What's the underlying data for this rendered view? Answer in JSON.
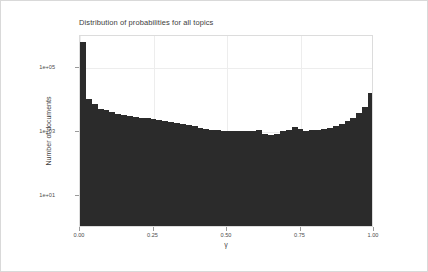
{
  "figure": {
    "title": "Distribution of probabilities for all topics",
    "background_color": "#ffffff",
    "border_color": "#d9d9d9",
    "panel_border_color": "#dcdcdc",
    "grid_color": "#ededed",
    "bar_color": "#2b2b2b"
  },
  "chart_data": {
    "type": "bar",
    "title": "Distribution of probabilities for all topics",
    "xlabel": "γ",
    "ylabel": "Number of documents",
    "grid": true,
    "legend": "none",
    "yscale": "log10",
    "xlim": [
      0.0,
      1.0
    ],
    "ylim": [
      1,
      1000000
    ],
    "xticks": [
      0.0,
      0.25,
      0.5,
      0.75,
      1.0
    ],
    "xtick_labels": [
      "0.00",
      "0.25",
      "0.50",
      "0.75",
      "1.00"
    ],
    "yticks": [
      10,
      1000,
      100000
    ],
    "ytick_labels": [
      "1e+01",
      "1e+03",
      "1e+05"
    ],
    "bin_width": 0.02,
    "bin_centers": [
      0.01,
      0.03,
      0.05,
      0.07,
      0.09,
      0.11,
      0.13,
      0.15,
      0.17,
      0.19,
      0.21,
      0.23,
      0.25,
      0.27,
      0.29,
      0.31,
      0.33,
      0.35,
      0.37,
      0.39,
      0.41,
      0.43,
      0.45,
      0.47,
      0.49,
      0.51,
      0.53,
      0.55,
      0.57,
      0.59,
      0.61,
      0.63,
      0.65,
      0.67,
      0.69,
      0.71,
      0.73,
      0.75,
      0.77,
      0.79,
      0.81,
      0.83,
      0.85,
      0.87,
      0.89,
      0.91,
      0.93,
      0.95,
      0.97,
      0.99
    ],
    "values": [
      560000,
      9200,
      6400,
      4700,
      4200,
      3600,
      3100,
      2900,
      2700,
      2500,
      2400,
      2300,
      2200,
      2000,
      1850,
      1750,
      1600,
      1500,
      1400,
      1300,
      1150,
      1050,
      1000,
      980,
      960,
      950,
      940,
      930,
      950,
      900,
      1000,
      760,
      700,
      740,
      900,
      1000,
      1250,
      1100,
      900,
      980,
      1000,
      1050,
      1150,
      1300,
      1500,
      1900,
      2400,
      3400,
      5400,
      14500
    ],
    "categories": [
      "0.01",
      "0.03",
      "0.05",
      "0.07",
      "0.09",
      "0.11",
      "0.13",
      "0.15",
      "0.17",
      "0.19",
      "0.21",
      "0.23",
      "0.25",
      "0.27",
      "0.29",
      "0.31",
      "0.33",
      "0.35",
      "0.37",
      "0.39",
      "0.41",
      "0.43",
      "0.45",
      "0.47",
      "0.49",
      "0.51",
      "0.53",
      "0.55",
      "0.57",
      "0.59",
      "0.61",
      "0.63",
      "0.65",
      "0.67",
      "0.69",
      "0.71",
      "0.73",
      "0.75",
      "0.77",
      "0.79",
      "0.81",
      "0.83",
      "0.85",
      "0.87",
      "0.89",
      "0.91",
      "0.93",
      "0.95",
      "0.97",
      "0.99"
    ]
  }
}
